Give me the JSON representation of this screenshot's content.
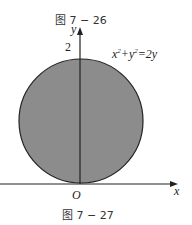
{
  "captions": {
    "top": "图 7 − 26",
    "bottom": "图 7 − 27"
  },
  "axes": {
    "x_label": "x",
    "y_label": "y",
    "origin_label": "O",
    "y_tick_label": "2"
  },
  "equation": {
    "parts": [
      "x",
      "2",
      "+y",
      "2",
      "=2y"
    ]
  },
  "colors": {
    "disk_fill": "#8c8c8c",
    "stroke": "#222222"
  }
}
